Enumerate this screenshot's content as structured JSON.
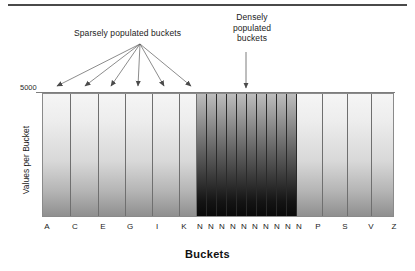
{
  "figure": {
    "x_axis_title": "Buckets",
    "y_axis_title": "Values per Bucket",
    "y_max_label": "5000",
    "annotations": {
      "sparse": "Sparsely populated buckets",
      "dense": "Densely populated buckets"
    }
  },
  "chart_data": {
    "type": "bar",
    "title": "",
    "xlabel": "Buckets",
    "ylabel": "Values per Bucket",
    "ylim": [
      0,
      5000
    ],
    "grid": false,
    "legend": null,
    "annotations": [
      {
        "text": "Sparsely populated buckets",
        "points_to": [
          "A",
          "C",
          "E",
          "G",
          "I",
          "K"
        ]
      },
      {
        "text": "Densely populated buckets",
        "points_to": [
          "N"
        ]
      }
    ],
    "categories": [
      "A",
      "C",
      "E",
      "G",
      "I",
      "K",
      "N",
      "N",
      "N",
      "N",
      "N",
      "N",
      "N",
      "N",
      "N",
      "N",
      "P",
      "S",
      "V",
      "Z"
    ],
    "tick_labels": [
      "A",
      "C",
      "E",
      "G",
      "I",
      "K",
      "N",
      "N",
      "N",
      "N",
      "N",
      "N",
      "N",
      "N",
      "N",
      "N",
      "P",
      "S",
      "V",
      "Z"
    ],
    "series": [
      {
        "name": "Values per Bucket",
        "values": [
          5000,
          5000,
          5000,
          5000,
          5000,
          5000,
          5000,
          5000,
          5000,
          5000,
          5000,
          5000,
          5000,
          5000,
          5000,
          5000,
          5000,
          5000,
          5000,
          5000
        ],
        "density": [
          "sparse",
          "sparse",
          "sparse",
          "sparse",
          "sparse",
          "sparse",
          "dense",
          "dense",
          "dense",
          "dense",
          "dense",
          "dense",
          "dense",
          "dense",
          "dense",
          "dense",
          "sparse",
          "sparse",
          "sparse",
          "sparse"
        ]
      }
    ]
  },
  "buckets": [
    {
      "label": "A",
      "density": "sparse",
      "x": 42,
      "w": 28
    },
    {
      "label": "C",
      "density": "sparse",
      "x": 70,
      "w": 28
    },
    {
      "label": "E",
      "density": "sparse",
      "x": 98,
      "w": 27
    },
    {
      "label": "G",
      "density": "sparse",
      "x": 125,
      "w": 27
    },
    {
      "label": "I",
      "density": "sparse",
      "x": 152,
      "w": 27
    },
    {
      "label": "K",
      "density": "sparse",
      "x": 179,
      "w": 17
    },
    {
      "label": "N",
      "density": "dense",
      "x": 196,
      "w": 10
    },
    {
      "label": "N",
      "density": "dense",
      "x": 206,
      "w": 10
    },
    {
      "label": "N",
      "density": "dense",
      "x": 216,
      "w": 10
    },
    {
      "label": "N",
      "density": "dense",
      "x": 226,
      "w": 10
    },
    {
      "label": "N",
      "density": "dense",
      "x": 236,
      "w": 10
    },
    {
      "label": "N",
      "density": "dense",
      "x": 246,
      "w": 10
    },
    {
      "label": "N",
      "density": "dense",
      "x": 256,
      "w": 10
    },
    {
      "label": "N",
      "density": "dense",
      "x": 266,
      "w": 10
    },
    {
      "label": "N",
      "density": "dense",
      "x": 276,
      "w": 10
    },
    {
      "label": "N",
      "density": "dense",
      "x": 286,
      "w": 10
    },
    {
      "label": "P",
      "density": "sparse",
      "x": 296,
      "w": 26
    },
    {
      "label": "S",
      "density": "sparse",
      "x": 322,
      "w": 25
    },
    {
      "label": "V",
      "density": "sparse",
      "x": 347,
      "w": 24
    },
    {
      "label": "Z",
      "density": "sparse",
      "x": 371,
      "w": 23
    }
  ],
  "tick_positions": [
    {
      "label": "A",
      "x": 47
    },
    {
      "label": "C",
      "x": 75
    },
    {
      "label": "E",
      "x": 103
    },
    {
      "label": "G",
      "x": 130
    },
    {
      "label": "I",
      "x": 157
    },
    {
      "label": "K",
      "x": 184
    },
    {
      "label": "N",
      "x": 200
    },
    {
      "label": "N",
      "x": 211
    },
    {
      "label": "N",
      "x": 222
    },
    {
      "label": "N",
      "x": 233
    },
    {
      "label": "N",
      "x": 244
    },
    {
      "label": "N",
      "x": 255
    },
    {
      "label": "N",
      "x": 266
    },
    {
      "label": "N",
      "x": 277
    },
    {
      "label": "N",
      "x": 288
    },
    {
      "label": "N",
      "x": 299
    },
    {
      "label": "P",
      "x": 318
    },
    {
      "label": "S",
      "x": 345
    },
    {
      "label": "V",
      "x": 371
    },
    {
      "label": "Z",
      "x": 394
    }
  ],
  "arrows": {
    "sparse_origin": {
      "x": 140,
      "y": 44
    },
    "sparse_tips": [
      {
        "x": 57,
        "y": 86
      },
      {
        "x": 85,
        "y": 86
      },
      {
        "x": 111,
        "y": 86
      },
      {
        "x": 138,
        "y": 86
      },
      {
        "x": 164,
        "y": 86
      },
      {
        "x": 191,
        "y": 86
      }
    ],
    "dense_line": {
      "x": 246,
      "y1": 52,
      "y2": 88
    }
  }
}
